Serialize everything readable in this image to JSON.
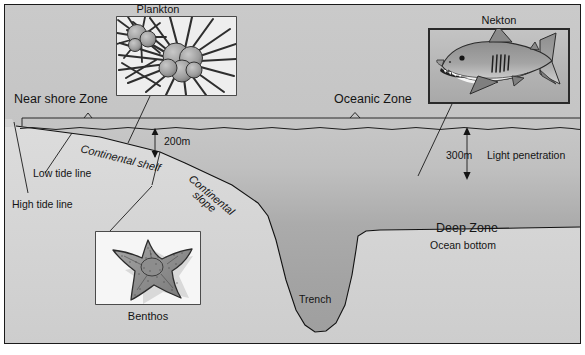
{
  "figure": {
    "frame_color": "#1a1a1a",
    "background_color": "#c9c9c9"
  },
  "zones": {
    "near_shore": "Near shore Zone",
    "oceanic": "Oceanic Zone",
    "deep": "Deep Zone"
  },
  "features": {
    "continental_shelf": "Continental shelf",
    "continental_slope": "Continental slope",
    "continental_slope_line1": "Continental",
    "continental_slope_line2": "slope",
    "trench": "Trench",
    "ocean_bottom": "Ocean bottom",
    "low_tide_line": "Low tide line",
    "high_tide_line": "High tide line"
  },
  "measurements": {
    "shelf_depth": "200m",
    "light_depth": "300m",
    "light_penetration_label": "Light penetration"
  },
  "organisms": [
    {
      "id": "plankton",
      "caption": "Plankton",
      "description": "radiolarian-plankton-illustration"
    },
    {
      "id": "nekton",
      "caption": "Nekton",
      "description": "great-white-shark-illustration"
    },
    {
      "id": "benthos",
      "caption": "Benthos",
      "description": "starfish-sea-star-illustration"
    }
  ],
  "colors": {
    "paper": "#c9c9c9",
    "water_top": "#c3c3c3",
    "water_deep": "#a9a9a9",
    "crust": "#d6d6d6",
    "ink": "#141414",
    "inset_border": "#2a2a2a",
    "plankton_bg": "#efefef",
    "nekton_bg": "#b6b6b6",
    "benthos_bg": "#f4f4f4"
  }
}
